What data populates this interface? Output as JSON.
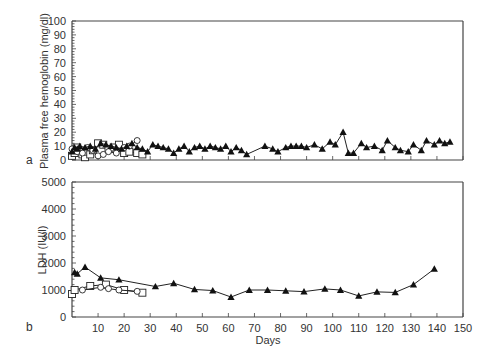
{
  "chart_data": [
    {
      "panel_label": "a",
      "type": "line",
      "title": "",
      "xlabel": "",
      "ylabel": "Plasma free hemoglobin (mg/dl)",
      "xlim": [
        0,
        150
      ],
      "ylim": [
        0,
        100
      ],
      "yticks": [
        0,
        10,
        20,
        30,
        40,
        50,
        60,
        70,
        80,
        90,
        100
      ],
      "xticks": [
        0,
        10,
        20,
        30,
        40,
        50,
        60,
        70,
        80,
        90,
        100,
        110,
        120,
        130,
        140,
        150
      ],
      "xtick_labels_shown": false,
      "grid": false,
      "legend": null,
      "series": [
        {
          "name": "triangle",
          "marker": "filled-triangle",
          "x": [
            0,
            1,
            2,
            3,
            5,
            7,
            9,
            11,
            13,
            15,
            17,
            19,
            21,
            23,
            25,
            27,
            29,
            31,
            33,
            35,
            37,
            39,
            41,
            43,
            45,
            47,
            49,
            51,
            53,
            55,
            57,
            59,
            61,
            63,
            65,
            67,
            74,
            77,
            79,
            82,
            84,
            86,
            88,
            90,
            93,
            96,
            99,
            101,
            104,
            106,
            108,
            111,
            113,
            116,
            119,
            121,
            124,
            126,
            129,
            131,
            134,
            136,
            139,
            141,
            143,
            145
          ],
          "y": [
            6,
            9,
            8,
            10,
            9,
            10,
            8,
            12,
            11,
            10,
            9,
            8,
            10,
            12,
            9,
            8,
            6,
            11,
            10,
            9,
            8,
            5,
            8,
            10,
            6,
            9,
            10,
            8,
            10,
            9,
            8,
            10,
            6,
            9,
            7,
            4,
            10,
            8,
            6,
            9,
            10,
            10,
            10,
            9,
            11,
            8,
            13,
            11,
            20,
            5,
            5,
            12,
            9,
            10,
            7,
            14,
            9,
            7,
            6,
            11,
            7,
            14,
            11,
            14,
            12,
            13,
            25,
            20,
            24,
            24,
            24
          ]
        },
        {
          "name": "square",
          "marker": "open-square",
          "x": [
            0,
            1,
            2,
            4,
            5,
            6,
            7,
            8,
            10,
            12,
            14,
            16,
            18,
            20,
            22,
            25,
            27
          ],
          "y": [
            3,
            5,
            9,
            4,
            2,
            6,
            4,
            7,
            12,
            11,
            8,
            9,
            11,
            5,
            6,
            5,
            4
          ]
        },
        {
          "name": "circle",
          "marker": "open-circle",
          "x": [
            0,
            2,
            4,
            6,
            8,
            10,
            12,
            14,
            17,
            20,
            22,
            25
          ],
          "y": [
            8,
            6,
            5,
            9,
            7,
            3,
            4,
            6,
            5,
            9,
            10,
            14
          ]
        }
      ]
    },
    {
      "panel_label": "b",
      "type": "line",
      "title": "",
      "xlabel": "Days",
      "ylabel": "LDH (IU/l)",
      "xlim": [
        0,
        150
      ],
      "ylim": [
        0,
        5000
      ],
      "yticks": [
        0,
        1000,
        2000,
        3000,
        4000,
        5000
      ],
      "xticks": [
        10,
        20,
        30,
        40,
        50,
        60,
        70,
        80,
        90,
        100,
        110,
        120,
        130,
        140,
        150
      ],
      "grid": false,
      "legend": null,
      "series": [
        {
          "name": "triangle",
          "marker": "filled-triangle",
          "x": [
            1,
            2,
            5,
            11,
            18,
            32,
            39,
            47,
            54,
            61,
            68,
            75,
            82,
            89,
            97,
            103,
            110,
            117,
            124,
            131,
            139
          ],
          "y": [
            1650,
            1600,
            1850,
            1450,
            1380,
            1130,
            1250,
            1020,
            980,
            740,
            1000,
            1000,
            970,
            940,
            1040,
            1000,
            780,
            930,
            910,
            1200,
            1780
          ]
        },
        {
          "name": "square",
          "marker": "open-square",
          "x": [
            0,
            1,
            7,
            13,
            20,
            27
          ],
          "y": [
            850,
            1000,
            1150,
            1200,
            1000,
            900
          ]
        },
        {
          "name": "circle",
          "marker": "open-circle",
          "x": [
            4,
            11,
            14,
            18,
            25
          ],
          "y": [
            1000,
            1100,
            1050,
            1000,
            950
          ]
        }
      ]
    }
  ],
  "labels": {
    "panel_a": "a",
    "panel_b": "b",
    "ylabel_a": "Plasma free hemoglobin (mg/dl)",
    "ylabel_b": "LDH (IU/l)",
    "xlabel_b": "Days"
  }
}
